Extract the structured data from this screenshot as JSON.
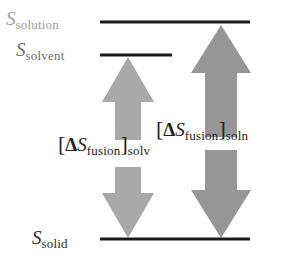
{
  "figure": {
    "type": "energy-level-diagram",
    "title": "",
    "background_color": "#ffffff"
  },
  "levels": [
    {
      "id": "solution",
      "symbol": "S",
      "subscript": "solution",
      "label_color": "#9d9d9d",
      "line_color": "#1a1a1a",
      "line_x1": 100,
      "line_x2": 250,
      "line_y": 22,
      "line_width": 3
    },
    {
      "id": "solvent",
      "symbol": "S",
      "subscript": "solvent",
      "label_color": "#6e6e6e",
      "line_color": "#1a1a1a",
      "line_x1": 100,
      "line_x2": 172,
      "line_y": 55,
      "line_width": 3
    },
    {
      "id": "solid",
      "symbol": "S",
      "subscript": "solid",
      "label_color": "#2b2b2b",
      "line_color": "#1a1a1a",
      "line_x1": 100,
      "line_x2": 250,
      "line_y": 239,
      "line_width": 3
    }
  ],
  "arrows": [
    {
      "id": "up-solv",
      "direction": "up",
      "color": "#a9a9a9",
      "from_level": "solid",
      "to_level": "solvent",
      "tip_x": 128,
      "tip_y": 57,
      "tail_y": 140,
      "head_half_width": 26,
      "shaft_half_width": 13,
      "head_length": 45
    },
    {
      "id": "down-solv",
      "direction": "down",
      "color": "#a9a9a9",
      "from_level": "solvent",
      "to_level": "solid",
      "tip_x": 128,
      "tip_y": 238,
      "tail_y": 167,
      "head_half_width": 26,
      "shaft_half_width": 13,
      "head_length": 45
    },
    {
      "id": "up-soln",
      "direction": "up",
      "color": "#969696",
      "from_level": "solid",
      "to_level": "solution",
      "tip_x": 221,
      "tip_y": 25,
      "tail_y": 137,
      "head_half_width": 30,
      "shaft_half_width": 16,
      "head_length": 48
    },
    {
      "id": "down-soln",
      "direction": "down",
      "color": "#969696",
      "from_level": "solution",
      "to_level": "solid",
      "tip_x": 221,
      "tip_y": 238,
      "tail_y": 150,
      "head_half_width": 30,
      "shaft_half_width": 16,
      "head_length": 48
    }
  ],
  "quantities": [
    {
      "id": "dsfus-solv",
      "open_bracket": "[",
      "delta": "Δ",
      "symbol": "S",
      "subscript": "fusion",
      "close_bracket": "]",
      "outer_subscript": "solv",
      "color": "#222222"
    },
    {
      "id": "dsfus-soln",
      "open_bracket": "[",
      "delta": "Δ",
      "symbol": "S",
      "subscript": "fusion",
      "close_bracket": "]",
      "outer_subscript": "soln",
      "color": "#222222"
    }
  ]
}
